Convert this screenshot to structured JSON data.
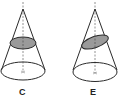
{
  "figure": {
    "colors": {
      "stroke": "#2a2a2a",
      "section_fill": "#9a9a9a",
      "axis": "#777777",
      "background": "#ffffff"
    },
    "cones": [
      {
        "label": "C",
        "section": "horizontal plane (circle section)"
      },
      {
        "label": "E",
        "section": "tilted plane (ellipse section)"
      }
    ]
  }
}
